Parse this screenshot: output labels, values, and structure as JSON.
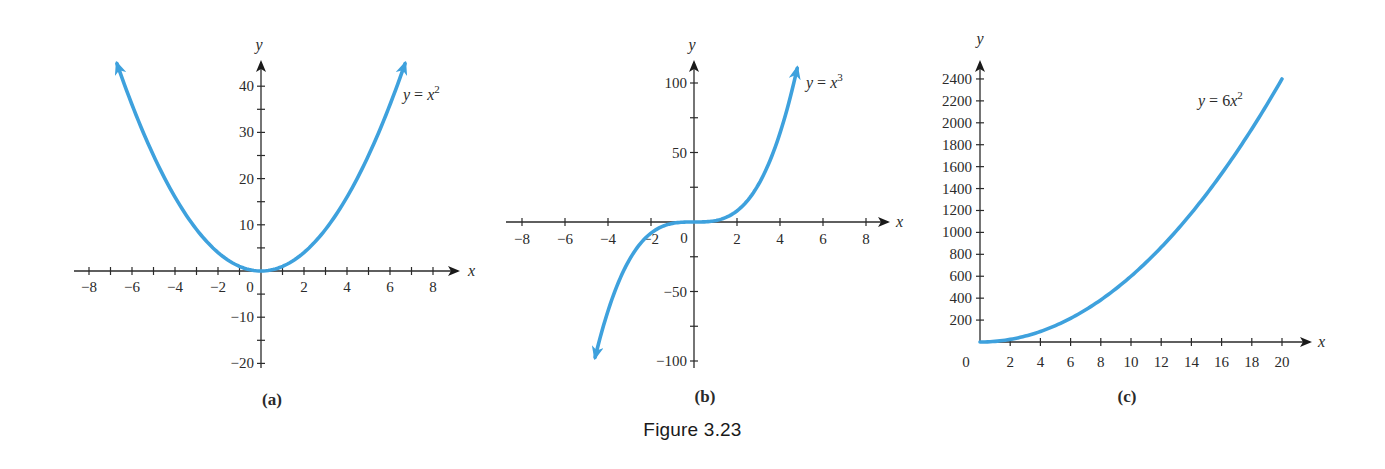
{
  "figure": {
    "caption": "Figure 3.23",
    "curve_color": "#3ea1dd",
    "axis_color": "#2a2a2a"
  },
  "chart_data": [
    {
      "type": "line",
      "panel_label": "(a)",
      "title": "",
      "equation": {
        "lhs": "y",
        "rhs_coef": "",
        "rhs_var": "x",
        "exponent": "2"
      },
      "xlabel": "x",
      "ylabel": "y",
      "xlim": [
        -8.5,
        9
      ],
      "ylim": [
        -20,
        45
      ],
      "x_ticks": [
        -8,
        -7,
        -6,
        -5,
        -4,
        -3,
        -2,
        -1,
        1,
        2,
        3,
        4,
        5,
        6,
        7,
        8
      ],
      "x_tick_labels": [
        {
          "value": -8,
          "label": "−8"
        },
        {
          "value": -6,
          "label": "−6"
        },
        {
          "value": -4,
          "label": "−4"
        },
        {
          "value": -2,
          "label": "−2"
        },
        {
          "value": 0,
          "label": "0"
        },
        {
          "value": 2,
          "label": "2"
        },
        {
          "value": 4,
          "label": "4"
        },
        {
          "value": 6,
          "label": "6"
        },
        {
          "value": 8,
          "label": "8"
        }
      ],
      "y_ticks": [
        -20,
        -15,
        -10,
        -5,
        5,
        10,
        15,
        20,
        25,
        30,
        35,
        40
      ],
      "y_tick_labels": [
        {
          "value": 40,
          "label": "40"
        },
        {
          "value": 30,
          "label": "30"
        },
        {
          "value": 20,
          "label": "20"
        },
        {
          "value": 10,
          "label": "10"
        },
        {
          "value": -10,
          "label": "−10"
        },
        {
          "value": -20,
          "label": "−20"
        }
      ],
      "function": "x^2",
      "domain": [
        -6.7,
        6.7
      ],
      "arrows": "both",
      "series": [
        {
          "name": "y = x^2",
          "x": [
            -6.7,
            -6,
            -4,
            -2,
            0,
            2,
            4,
            6,
            6.7
          ],
          "y": [
            44.9,
            36,
            16,
            4,
            0,
            4,
            16,
            36,
            44.9
          ]
        }
      ],
      "grid": false
    },
    {
      "type": "line",
      "panel_label": "(b)",
      "title": "",
      "equation": {
        "lhs": "y",
        "rhs_coef": "",
        "rhs_var": "x",
        "exponent": "3"
      },
      "xlabel": "x",
      "ylabel": "y",
      "xlim": [
        -8.5,
        9
      ],
      "ylim": [
        -100,
        115
      ],
      "x_ticks": [
        -8,
        -6,
        -4,
        -2,
        2,
        4,
        6,
        8
      ],
      "x_tick_labels": [
        {
          "value": -8,
          "label": "−8"
        },
        {
          "value": -6,
          "label": "−6"
        },
        {
          "value": -4,
          "label": "−4"
        },
        {
          "value": -2,
          "label": "−2"
        },
        {
          "value": 0,
          "label": "0"
        },
        {
          "value": 2,
          "label": "2"
        },
        {
          "value": 4,
          "label": "4"
        },
        {
          "value": 6,
          "label": "6"
        },
        {
          "value": 8,
          "label": "8"
        }
      ],
      "y_ticks": [
        -100,
        -75,
        -50,
        -25,
        25,
        50,
        75,
        100
      ],
      "y_tick_labels": [
        {
          "value": 100,
          "label": "100"
        },
        {
          "value": 50,
          "label": "50"
        },
        {
          "value": -50,
          "label": "−50"
        },
        {
          "value": -100,
          "label": "−100"
        }
      ],
      "function": "x^3",
      "domain": [
        -4.6,
        4.8
      ],
      "arrows": "both",
      "series": [
        {
          "name": "y = x^3",
          "x": [
            -4.6,
            -4,
            -2,
            0,
            2,
            4,
            4.8
          ],
          "y": [
            -97.3,
            -64,
            -8,
            0,
            8,
            64,
            110.6
          ]
        }
      ],
      "grid": false
    },
    {
      "type": "line",
      "panel_label": "(c)",
      "title": "",
      "equation": {
        "lhs": "y",
        "rhs_coef": "6",
        "rhs_var": "x",
        "exponent": "2"
      },
      "xlabel": "x",
      "ylabel": "y",
      "xlim": [
        0,
        21.5
      ],
      "ylim": [
        0,
        2600
      ],
      "x_ticks": [
        2,
        4,
        6,
        8,
        10,
        12,
        14,
        16,
        18,
        20
      ],
      "x_tick_labels": [
        {
          "value": 0,
          "label": "0"
        },
        {
          "value": 2,
          "label": "2"
        },
        {
          "value": 4,
          "label": "4"
        },
        {
          "value": 6,
          "label": "6"
        },
        {
          "value": 8,
          "label": "8"
        },
        {
          "value": 10,
          "label": "10"
        },
        {
          "value": 12,
          "label": "12"
        },
        {
          "value": 14,
          "label": "14"
        },
        {
          "value": 16,
          "label": "16"
        },
        {
          "value": 18,
          "label": "18"
        },
        {
          "value": 20,
          "label": "20"
        }
      ],
      "y_ticks": [
        200,
        400,
        600,
        800,
        1000,
        1200,
        1400,
        1600,
        1800,
        2000,
        2200,
        2400
      ],
      "y_tick_labels": [
        {
          "value": 2400,
          "label": "2400"
        },
        {
          "value": 2200,
          "label": "2200"
        },
        {
          "value": 2000,
          "label": "2000"
        },
        {
          "value": 1800,
          "label": "1800"
        },
        {
          "value": 1600,
          "label": "1600"
        },
        {
          "value": 1400,
          "label": "1400"
        },
        {
          "value": 1200,
          "label": "1200"
        },
        {
          "value": 1000,
          "label": "1000"
        },
        {
          "value": 800,
          "label": "800"
        },
        {
          "value": 600,
          "label": "600"
        },
        {
          "value": 400,
          "label": "400"
        },
        {
          "value": 200,
          "label": "200"
        }
      ],
      "function": "6*x^2",
      "domain": [
        0,
        20
      ],
      "arrows": "none",
      "series": [
        {
          "name": "y = 6x^2",
          "x": [
            0,
            2,
            4,
            6,
            8,
            10,
            12,
            14,
            16,
            18,
            20
          ],
          "y": [
            0,
            24,
            96,
            216,
            384,
            600,
            864,
            1176,
            1536,
            1944,
            2400
          ]
        }
      ],
      "grid": false
    }
  ]
}
